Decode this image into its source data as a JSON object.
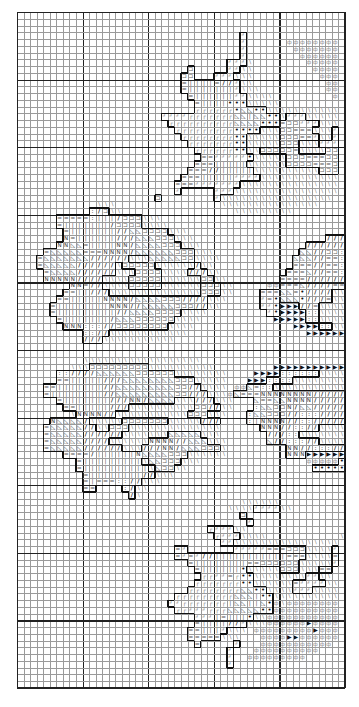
{
  "chart_data": {
    "type": "table",
    "title": "",
    "grid": {
      "cols": 50,
      "rows": 100,
      "major_every": 10,
      "grid_on": true
    },
    "symbols": {
      "%": "s-pct",
      "/": "s-slash",
      "T": "s-tri",
      "C": "s-br",
      "L": "s-L",
      "N": "s-N",
      "=": "s-eq",
      "|": "s-bar",
      "o": "s-dot",
      ">": "s-arr",
      "Q": "s-Q",
      ":": "s-col",
      "r": "s-r"
    },
    "glyphs": {
      "%": "∖",
      "/": "∕",
      "T": "◺",
      "C": "⊐",
      "L": "┘",
      "N": "N",
      "=": "=",
      "|": "|",
      "o": "•",
      ">": "▶",
      "Q": "ф",
      ":": ":",
      "r": "┌"
    },
    "rows": [
      "..................................................",
      "..................................................",
      "..................................................",
      "..................................L...............",
      "..................................L......QQQQQQQQ",
      "..................................L.......QQQQQQQ",
      "..................................L........QQQQQQ",
      "................................LLL%........QQQQQ",
      "..........................C.....LL%%.........QQQQ",
      ".........................CC...LLL%%%..........QQQ",
      ".........................=||||=//L%%...........QQ",
      ".........................=|||||||L%%%..........QQ",
      "..........................=||||||LL%%%%.........Q",
      "...........................=||||ooo%%%%%.........",
      "...........................rrrrrroTToo%%%%%%%%%%%",
      "......................LLLLrrrrrrrTT|TToo%LLL%%%%%",
      ".......................rrrrrrrrrrTTTTooo=CCLLL%%%",
      "........................rrrrrrrrroooo%%%CC===%%%L",
      ".........................rrrrrrrroo%%%%%CCC==L%%L",
      "..........................rrrrrrroo%%%%%CCC%%%LLL",
      "...........................rrrrrroo%%CCCCC=%%%%CC",
      "............................==LLLLLo%%%%%CCC===CC",
      "...........................===|||||%%%%%%CCCC===C",
      "..........................===//|||||%%%%%%%%%%CCC",
      ".........................===|||||LLLL%%%%%%%%%%%%",
      "........................===LLLLLLL%%%%%%%%%%%%%%%",
      "........................L.....LLL%%%%%%%%%%%%%%%%",
      ".....................C........L%%%%%%%%%%%%%%%%%.",
      "............%%%................%%%%%%%%%%%%%%%...",
      "...........:/C%%.................%%%%%%%%%.......",
      "......=====:|||/CCC%%%...........................",
      "......=|||||||/CCCC%%%%..........................",
      ".......=|||||||//TTCCCC%%%.......................",
      ".......N=||||||///TTTCCC%%%....................///>>>>>",
      "......NNTT=||||NN/TTTTCCC%%%................///////.",
      "....=TTTTT===NNNN/TTTTTTCCC%%%.............TT//CC::%",
      "...=TTTTTTT//////%%%TTTTTCC%%%%...........TTT//==::%",
      "...=TTTTT//////%CCCCC%%%%%%/%%............===//==::%",
      "....=TTTT//////%%%CCCC%%%%///%%..........===T//==:%%",
      "....NNNNN////%%%%CCCCC%%%%%%CC%%........====//////%%",
      "........NN=//%%%%CCCCC%%%%%%CCC%%.....QQ===T////===%",
      ".......==||///%%%%%%%%%%%%%%CCC%%....===TT=o////%%%%",
      "......==|||||NNNN/TTTTCCC////%%%.....L=oTTTo///=%%%%",
      ".....=||||||||NNN//TTTTTCCC//%%......LLo>>>//=%%%%%%",
      ".....=|||||||||//TTTTCCCC%%%%.........Lo>>>>::%%%%%%",
      "......=|||||||/TTTCCCCCC%%%%...........>>>>>::%%%%%%",
      ".......NNN::://CCCCCCCC%%%%...............>>>>::%%%%",
      "..........:://%%%%%%%%%%%%..................>>>>>>>>",
      "..........///%%%%%%%%%%%.........................",
      "..................................................",
      "..................................................",
      "..........%%%%%%%%%%%%%%%%%%.....................",
      "........%%%CCCCCCCCC%%%%%%%%%%.........>>>>>>>>>>>>>",
      "......::////TTTTTTCCCCCC%%%%%%%%....>>>>::::::%%%%",
      "......==|||||///TTTTTTTTCCC%%%%%...>>>::::%%%%%%%%",
      "....==|||||||//TTTTTTTTTCC//%%%%.QQT=::%%%%%%%%%%%",
      "....=||||||||//TTTTTTTTTCC///%%%QT===NNNNNNNN//////",
      "......=|||||||///NN/TTTT%%%///%%%...T==TTNNNN//////",
      ".......==|||||///%%%%%%%%%%CC//%%...:TTCCN/TT//////",
      "........%NNNN//%%%%%%%%%%%CCC%%%...:TTCCC//::://///",
      ".....NTTTT/%%%%%CCCCCCC%%%%%///....:|NNNN//:://////",
      "....=TTTTT//%%CCC%%%%%%%%%%%%%%......NNN//:://%%%%%",
      "....=TTTTT//////%%%%%%%TTTTT%%%.......///::%%%%%%%%",
      "....=TTTTT////%%%%%%NNNN//TTT%%%......T//::://%%%%/",
      "....=TTTTT//////%%%///NN/TTTCCC%.........NN//::://%",
      ".......====/||||||NTTTTCCC%%%%%%.........NNN>>>>>>>>",
      ".........=|||||||||%TTCCC%%%................QQQQQoo",
      ".........=||||||||||%TCC%%...................ooooooo",
      "..........=||||||||//%%%.........................",
      "..........=|===:://%%%...........................",
      "..........==....:/%%.............................",
      "................./%..............................",
      "..................................%%%%%%.........",
      "................................%%%%LLLL%%.......",
      "..................................C..............",
      "...................................L.............",
      ".............................rLLL%%..............",
      "..............................rLLL%%%%...........%",
      "...............................LL%%%%%%%%%%%%%%%%",
      "........................=L.......LLLLL===CCC%%%%L",
      "........................=L=L//|||||||||||===%%%%=",
      "..........................=||||||||==CCCCCC%%%%%L",
      "...........................=||||||o%%%%%CCC%%%==",
      "............................rrLL=roo%%%%%%%%LL%%",
      "...........................rrrrrrroo%%%%%%=LLLL%%",
      "..........................rrrrrrrrTToo%%%%LLL%%%%",
      "........................rrrrrrrrrTTT|oo%%%%%%%%%%",
      ".......................LLrrrrrrr|TT||ToQ%QQQQQQQQ",
      "........................rrLLLrrrTTTTTooQQQQQQQQQQ",
      "...........................LLL|=|||o%%QQQQQQQQQQQ",
      "...........................=||||//L%%%QQQQQQ>QQQQ",
      "..........................==|||L%%%.QQQQQQQQQ>QQQ",
      "..........................=====%%%...QQQQ>>QQQQQQ",
      "...........................=.....L...QQQQQQQQQQQ.",
      "................................L...QQQQQQQQQQ...",
      "................................L..QQQQQQQQQ.....",
      "................................L................"
    ]
  }
}
